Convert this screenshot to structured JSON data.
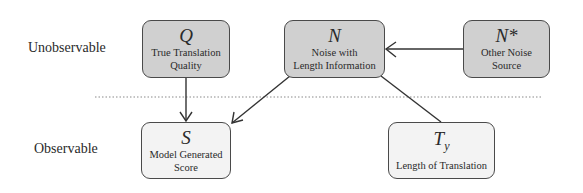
{
  "diagram": {
    "row_labels": {
      "top": "Unobservable",
      "bottom": "Observable"
    },
    "nodes": {
      "Q": {
        "symbol": "Q",
        "desc_line1": "True Translation",
        "desc_line2": "Quality",
        "observed": false
      },
      "N": {
        "symbol": "N",
        "desc_line1": "Noise with",
        "desc_line2": "Length Information",
        "observed": false
      },
      "N_star": {
        "symbol": "N*",
        "desc_line1": "Other Noise",
        "desc_line2": "Source",
        "observed": false
      },
      "S": {
        "symbol": "S",
        "desc_line1": "Model Generated",
        "desc_line2": "Score",
        "observed": true
      },
      "T_y": {
        "symbol_base": "T",
        "symbol_sub": "y",
        "desc_line1": "Length of Translation",
        "observed": true
      }
    },
    "edges": [
      {
        "from": "Q",
        "to": "S",
        "arrow": true
      },
      {
        "from": "N",
        "to": "S",
        "arrow": true
      },
      {
        "from": "N_star",
        "to": "N",
        "arrow": true
      },
      {
        "from": "N",
        "to": "T_y",
        "arrow": false
      }
    ],
    "separator": "dotted",
    "colors": {
      "unobservable_fill": "#d0d0d0",
      "observable_fill": "#f3f3f3",
      "stroke": "#4a4a4a"
    }
  }
}
